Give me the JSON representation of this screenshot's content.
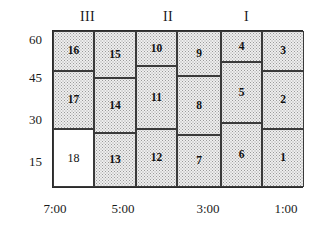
{
  "chart_data": {
    "type": "table",
    "title": "",
    "xlabel": "",
    "ylabel": "",
    "xlim": [
      "7:00",
      "1:00"
    ],
    "ylim": [
      7.5,
      60
    ],
    "grid": false,
    "legend_position": "top",
    "x_tick_labels": [
      "7:00",
      "5:00",
      "3:00",
      "1:00"
    ],
    "y_tick_labels": [
      "60",
      "45",
      "30",
      "15"
    ],
    "group_labels": [
      "III",
      "II",
      "I"
    ],
    "columns": [
      {
        "index": 1,
        "cells": [
          {
            "label": "16",
            "y_top": 60,
            "y_bottom": 45,
            "shaded": true
          },
          {
            "label": "17",
            "y_top": 45,
            "y_bottom": 23,
            "shaded": true
          },
          {
            "label": "18",
            "y_top": 23,
            "y_bottom": 7.5,
            "shaded": false
          }
        ]
      },
      {
        "index": 2,
        "cells": [
          {
            "label": "15",
            "y_top": 60,
            "y_bottom": 42,
            "shaded": true
          },
          {
            "label": "14",
            "y_top": 42,
            "y_bottom": 21,
            "shaded": true
          },
          {
            "label": "13",
            "y_top": 21,
            "y_bottom": 7.5,
            "shaded": true
          }
        ]
      },
      {
        "index": 3,
        "cells": [
          {
            "label": "10",
            "y_top": 60,
            "y_bottom": 47,
            "shaded": true
          },
          {
            "label": "11",
            "y_top": 47,
            "y_bottom": 22,
            "shaded": true
          },
          {
            "label": "12",
            "y_top": 22,
            "y_bottom": 7.5,
            "shaded": true
          }
        ]
      },
      {
        "index": 4,
        "cells": [
          {
            "label": "9",
            "y_top": 60,
            "y_bottom": 43,
            "shaded": true
          },
          {
            "label": "8",
            "y_top": 43,
            "y_bottom": 20,
            "shaded": true
          },
          {
            "label": "7",
            "y_top": 20,
            "y_bottom": 7.5,
            "shaded": true
          }
        ]
      },
      {
        "index": 5,
        "cells": [
          {
            "label": "4",
            "y_top": 60,
            "y_bottom": 48,
            "shaded": true
          },
          {
            "label": "5",
            "y_top": 48,
            "y_bottom": 25,
            "shaded": true
          },
          {
            "label": "6",
            "y_top": 25,
            "y_bottom": 7.5,
            "shaded": true
          }
        ]
      },
      {
        "index": 6,
        "cells": [
          {
            "label": "3",
            "y_top": 60,
            "y_bottom": 45,
            "shaded": true
          },
          {
            "label": "2",
            "y_top": 45,
            "y_bottom": 23,
            "shaded": true
          },
          {
            "label": "1",
            "y_top": 23,
            "y_bottom": 7.5,
            "shaded": true
          }
        ]
      }
    ]
  },
  "axes": {
    "y_ticks": [
      {
        "label": "60",
        "top": 33
      },
      {
        "label": "45",
        "top": 71
      },
      {
        "label": "30",
        "top": 113
      },
      {
        "label": "15",
        "top": 155
      }
    ],
    "x_ticks": [
      {
        "label": "7:00",
        "left": 32
      },
      {
        "label": "5:00",
        "left": 100
      },
      {
        "label": "3:00",
        "left": 185
      },
      {
        "label": "1:00",
        "left": 263
      }
    ]
  },
  "groups": [
    {
      "label": "III",
      "left": 80
    },
    {
      "label": "II",
      "left": 163
    },
    {
      "label": "I",
      "left": 244
    }
  ],
  "cells": [
    {
      "id": "c16",
      "label": "16",
      "left": 0,
      "top": 0,
      "width": 41,
      "height": 40,
      "shaded": true
    },
    {
      "id": "c17",
      "label": "17",
      "left": 0,
      "top": 40,
      "width": 41,
      "height": 58,
      "shaded": true
    },
    {
      "id": "c18",
      "label": "18",
      "left": 0,
      "top": 98,
      "width": 41,
      "height": 58,
      "shaded": false
    },
    {
      "id": "c15",
      "label": "15",
      "left": 41,
      "top": 0,
      "width": 42,
      "height": 47,
      "shaded": true
    },
    {
      "id": "c14",
      "label": "14",
      "left": 41,
      "top": 47,
      "width": 42,
      "height": 55,
      "shaded": true
    },
    {
      "id": "c13",
      "label": "13",
      "left": 41,
      "top": 102,
      "width": 42,
      "height": 54,
      "shaded": true
    },
    {
      "id": "c10",
      "label": "10",
      "left": 83,
      "top": 0,
      "width": 41,
      "height": 35,
      "shaded": true
    },
    {
      "id": "c11",
      "label": "11",
      "left": 83,
      "top": 35,
      "width": 41,
      "height": 63,
      "shaded": true
    },
    {
      "id": "c12",
      "label": "12",
      "left": 83,
      "top": 98,
      "width": 41,
      "height": 58,
      "shaded": true
    },
    {
      "id": "c9",
      "label": "9",
      "left": 124,
      "top": 0,
      "width": 44,
      "height": 45,
      "shaded": true
    },
    {
      "id": "c8",
      "label": "8",
      "left": 124,
      "top": 45,
      "width": 44,
      "height": 59,
      "shaded": true
    },
    {
      "id": "c7",
      "label": "7",
      "left": 124,
      "top": 104,
      "width": 44,
      "height": 52,
      "shaded": true
    },
    {
      "id": "c4",
      "label": "4",
      "left": 168,
      "top": 0,
      "width": 41,
      "height": 31,
      "shaded": true
    },
    {
      "id": "c5",
      "label": "5",
      "left": 168,
      "top": 31,
      "width": 41,
      "height": 61,
      "shaded": true
    },
    {
      "id": "c6",
      "label": "6",
      "left": 168,
      "top": 92,
      "width": 41,
      "height": 64,
      "shaded": true
    },
    {
      "id": "c3",
      "label": "3",
      "left": 209,
      "top": 0,
      "width": 42,
      "height": 40,
      "shaded": true
    },
    {
      "id": "c2",
      "label": "2",
      "left": 209,
      "top": 40,
      "width": 42,
      "height": 58,
      "shaded": true
    },
    {
      "id": "c1",
      "label": "1",
      "left": 209,
      "top": 98,
      "width": 42,
      "height": 58,
      "shaded": true
    }
  ]
}
